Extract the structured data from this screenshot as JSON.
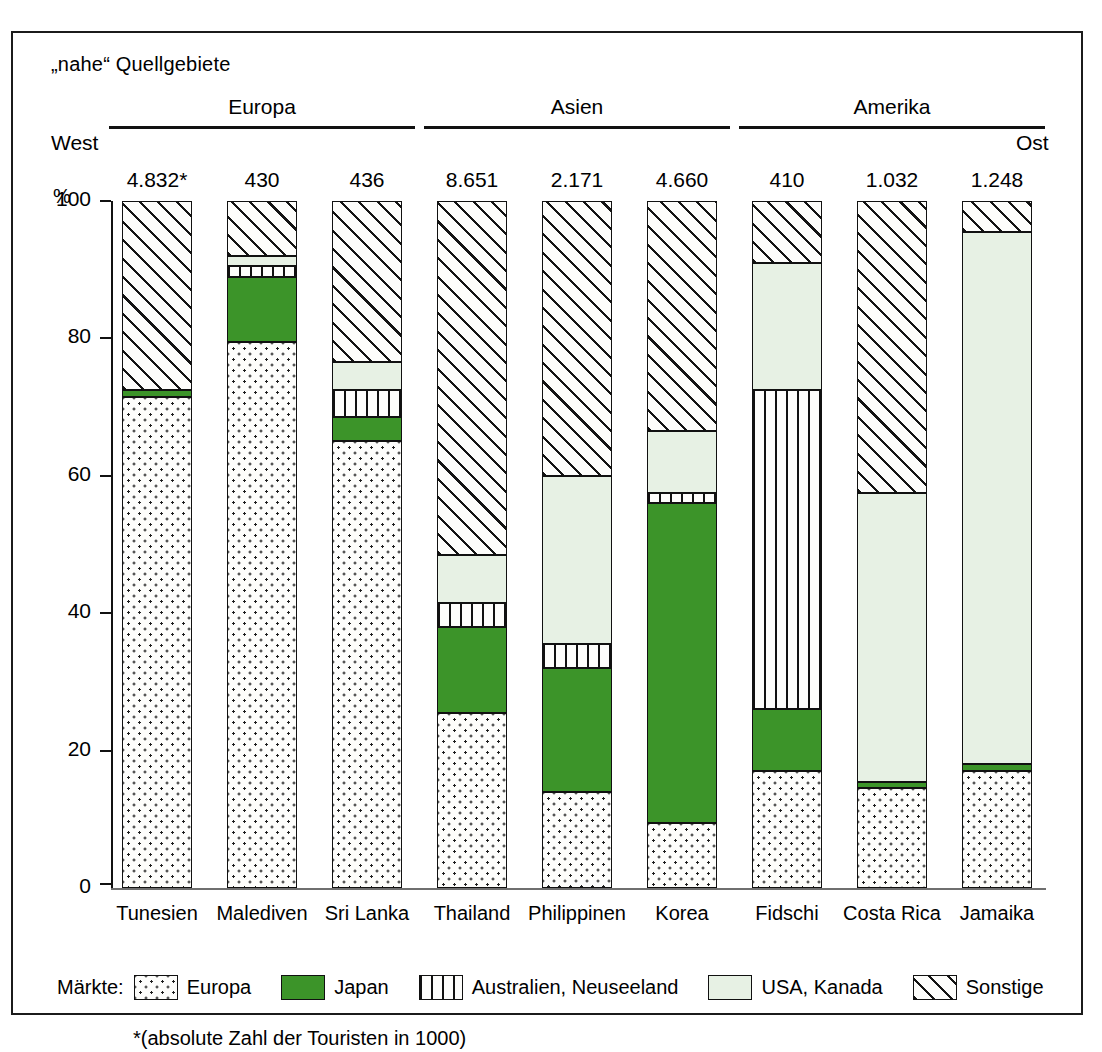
{
  "title": "„nahe“ Quellgebiete",
  "axis": {
    "west": "West",
    "ost": "Ost",
    "unit": "%",
    "yticks": [
      "100",
      "80",
      "60",
      "40",
      "20",
      "0"
    ]
  },
  "regions": [
    {
      "name": "Europa",
      "span": 3
    },
    {
      "name": "Asien",
      "span": 3
    },
    {
      "name": "Amerika",
      "span": 3
    }
  ],
  "legend": {
    "title": "Märkte:",
    "items": [
      {
        "label": "Europa",
        "key": "europa",
        "color": "#fdfdfb"
      },
      {
        "label": "Japan",
        "key": "japan",
        "color": "#3c9429"
      },
      {
        "label": "Australien, Neuseeland",
        "key": "austral",
        "color": "#fdfdfb"
      },
      {
        "label": "USA, Kanada",
        "key": "usa",
        "color": "#e7f1e4"
      },
      {
        "label": "Sonstige",
        "key": "sonstige",
        "color": "#fdfdfb"
      }
    ]
  },
  "footnote": "*(absolute Zahl der Touristen in 1000)",
  "chart_data": {
    "type": "bar",
    "title": "„nahe“ Quellgebiete",
    "xlabel": "",
    "ylabel": "%",
    "ylim": [
      0,
      100
    ],
    "grid": false,
    "stacked": true,
    "legend_position": "bottom",
    "categories": [
      "Tunesien",
      "Malediven",
      "Sri Lanka",
      "Thailand",
      "Philippinen",
      "Korea",
      "Fidschi",
      "Costa Rica",
      "Jamaika"
    ],
    "totals": [
      "4.832*",
      "430",
      "436",
      "8.651",
      "2.171",
      "4.660",
      "410",
      "1.032",
      "1.248"
    ],
    "series": [
      {
        "name": "Europa",
        "values": [
          71.5,
          79.5,
          65.0,
          25.5,
          14.0,
          9.5,
          17.0,
          14.5,
          17.0
        ]
      },
      {
        "name": "Japan",
        "values": [
          1.0,
          9.5,
          3.5,
          12.5,
          18.0,
          46.5,
          9.0,
          1.0,
          1.0
        ]
      },
      {
        "name": "Australien, Neuseeland",
        "values": [
          0.0,
          1.5,
          4.0,
          3.5,
          3.5,
          1.5,
          46.5,
          0.0,
          0.0
        ]
      },
      {
        "name": "USA, Kanada",
        "values": [
          0.0,
          1.5,
          4.0,
          7.0,
          24.5,
          9.0,
          18.5,
          42.0,
          77.5
        ]
      },
      {
        "name": "Sonstige",
        "values": [
          27.5,
          8.0,
          23.5,
          51.5,
          40.0,
          33.5,
          9.0,
          42.5,
          4.5
        ]
      }
    ]
  }
}
